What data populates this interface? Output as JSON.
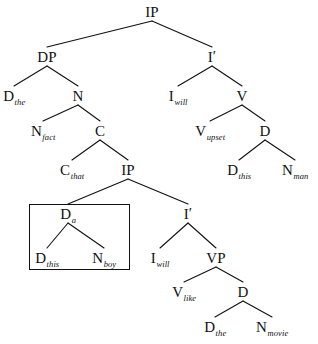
{
  "figure": {
    "width": 318,
    "height": 344,
    "background": "#ffffff",
    "line_color": "#111111",
    "text_color": "#111111"
  },
  "nodes": {
    "ip_root": {
      "cat": "IP",
      "sub": "",
      "x": 152,
      "y": 12
    },
    "dp": {
      "cat": "DP",
      "sub": "",
      "x": 47,
      "y": 57
    },
    "i_bar_top": {
      "cat": "I",
      "sub": "",
      "prime": "′",
      "x": 212,
      "y": 57
    },
    "d_the_top": {
      "cat": "D",
      "sub": "the",
      "x": 14,
      "y": 96
    },
    "n_top": {
      "cat": "N",
      "sub": "",
      "x": 78,
      "y": 96
    },
    "i_will_top": {
      "cat": "I",
      "sub": "will",
      "x": 178,
      "y": 96
    },
    "v_top": {
      "cat": "V",
      "sub": "",
      "x": 242,
      "y": 96
    },
    "n_fact": {
      "cat": "N",
      "sub": "fact",
      "x": 43,
      "y": 131
    },
    "c_node": {
      "cat": "C",
      "sub": "",
      "x": 100,
      "y": 131
    },
    "v_upset": {
      "cat": "V",
      "sub": "upset",
      "x": 210,
      "y": 131
    },
    "d_mid_right": {
      "cat": "D",
      "sub": "",
      "x": 265,
      "y": 131
    },
    "c_that": {
      "cat": "C",
      "sub": "that",
      "x": 72,
      "y": 170
    },
    "ip_embedded": {
      "cat": "IP",
      "sub": "",
      "x": 128,
      "y": 170
    },
    "d_this_right": {
      "cat": "D",
      "sub": "this",
      "x": 239,
      "y": 170
    },
    "n_man": {
      "cat": "N",
      "sub": "man",
      "x": 295,
      "y": 170
    },
    "d_a_boxed": {
      "cat": "D",
      "sub": "a",
      "x": 68,
      "y": 214
    },
    "i_bar_low": {
      "cat": "I",
      "sub": "",
      "prime": "′",
      "x": 188,
      "y": 214
    },
    "d_this_boxed": {
      "cat": "D",
      "sub": "this",
      "x": 47,
      "y": 258
    },
    "n_boy_boxed": {
      "cat": "N",
      "sub": "boy",
      "x": 104,
      "y": 258
    },
    "i_will_low": {
      "cat": "I",
      "sub": "will",
      "x": 160,
      "y": 258
    },
    "vp": {
      "cat": "VP",
      "sub": "",
      "x": 216,
      "y": 258
    },
    "v_like": {
      "cat": "V",
      "sub": "like",
      "x": 184,
      "y": 292
    },
    "d_low_right": {
      "cat": "D",
      "sub": "",
      "x": 243,
      "y": 292
    },
    "d_the_low": {
      "cat": "D",
      "sub": "the",
      "x": 215,
      "y": 327
    },
    "n_movie": {
      "cat": "N",
      "sub": "movie",
      "x": 272,
      "y": 327
    }
  },
  "edges": [
    {
      "from": "ip_root",
      "to": "dp"
    },
    {
      "from": "ip_root",
      "to": "i_bar_top"
    },
    {
      "from": "dp",
      "to": "d_the_top"
    },
    {
      "from": "dp",
      "to": "n_top"
    },
    {
      "from": "i_bar_top",
      "to": "i_will_top"
    },
    {
      "from": "i_bar_top",
      "to": "v_top"
    },
    {
      "from": "n_top",
      "to": "n_fact"
    },
    {
      "from": "n_top",
      "to": "c_node"
    },
    {
      "from": "v_top",
      "to": "v_upset"
    },
    {
      "from": "v_top",
      "to": "d_mid_right"
    },
    {
      "from": "c_node",
      "to": "c_that"
    },
    {
      "from": "c_node",
      "to": "ip_embedded"
    },
    {
      "from": "d_mid_right",
      "to": "d_this_right"
    },
    {
      "from": "d_mid_right",
      "to": "n_man"
    },
    {
      "from": "ip_embedded",
      "to": "d_a_boxed"
    },
    {
      "from": "ip_embedded",
      "to": "i_bar_low"
    },
    {
      "from": "d_a_boxed",
      "to": "d_this_boxed"
    },
    {
      "from": "d_a_boxed",
      "to": "n_boy_boxed"
    },
    {
      "from": "i_bar_low",
      "to": "i_will_low"
    },
    {
      "from": "i_bar_low",
      "to": "vp"
    },
    {
      "from": "vp",
      "to": "v_like"
    },
    {
      "from": "vp",
      "to": "d_low_right"
    },
    {
      "from": "d_low_right",
      "to": "d_the_low"
    },
    {
      "from": "d_low_right",
      "to": "n_movie"
    }
  ],
  "box": {
    "x": 29,
    "y": 204,
    "width": 99,
    "height": 64
  }
}
